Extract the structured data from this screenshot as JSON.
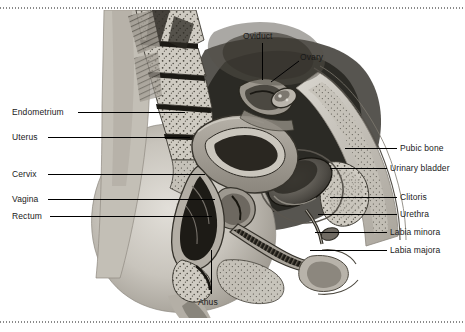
{
  "figure": {
    "background_color": "#ffffff",
    "border_style": "dotted-rule",
    "border_color": "#8a8a8a",
    "label_color": "#1a1a1a",
    "leader_color": "#000000",
    "width": 465,
    "height": 332
  },
  "labels": {
    "endometrium": "Endometrium",
    "uterus": "Uterus",
    "cervix": "Cervix",
    "vagina": "Vagina",
    "rectum": "Rectum",
    "oviduct": "Oviduct",
    "ovary": "Ovary",
    "pubic_bone": "Pubic bone",
    "urinary_bladder": "Urinary bladder",
    "clitoris": "Clitoris",
    "urethra": "Urethra",
    "labia_minora": "Labia minora",
    "labia_majora": "Labia majora",
    "anus": "Anus"
  },
  "label_positions": {
    "endometrium": {
      "x": 12,
      "y": 107,
      "side": "left",
      "line_from": 78,
      "line_to": 185,
      "line_y": 112
    },
    "uterus": {
      "x": 12,
      "y": 132,
      "side": "left",
      "line_from": 48,
      "line_to": 190,
      "line_y": 137
    },
    "cervix": {
      "x": 12,
      "y": 169,
      "side": "left",
      "line_from": 48,
      "line_to": 205,
      "line_y": 174
    },
    "vagina": {
      "x": 12,
      "y": 194,
      "side": "left",
      "line_from": 48,
      "line_to": 215,
      "line_y": 199
    },
    "rectum": {
      "x": 12,
      "y": 211,
      "side": "left",
      "line_from": 50,
      "line_to": 212,
      "line_y": 216
    },
    "oviduct": {
      "x": 243,
      "y": 31,
      "side": "top",
      "line_x": 262,
      "line_y1": 43,
      "line_y2": 80
    },
    "ovary": {
      "x": 300,
      "y": 52,
      "side": "top",
      "line_x1": 298,
      "line_y1": 62,
      "line_x2": 272,
      "line_y2": 82
    },
    "pubic_bone": {
      "x": 400,
      "y": 143,
      "side": "right",
      "line_from": 345,
      "line_to": 397,
      "line_y": 148
    },
    "urinary_bladder": {
      "x": 390,
      "y": 163,
      "side": "right",
      "line_from": 330,
      "line_to": 387,
      "line_y": 168
    },
    "clitoris": {
      "x": 400,
      "y": 192,
      "side": "right",
      "line_from": 330,
      "line_to": 397,
      "line_y": 197
    },
    "urethra": {
      "x": 400,
      "y": 209,
      "side": "right",
      "line_from": 318,
      "line_to": 397,
      "line_y": 214
    },
    "labia_minora": {
      "x": 390,
      "y": 227,
      "side": "right",
      "line_from": 315,
      "line_to": 387,
      "line_y": 232
    },
    "labia_majora": {
      "x": 390,
      "y": 245,
      "side": "right",
      "line_from": 310,
      "line_to": 387,
      "line_y": 250
    },
    "anus": {
      "x": 198,
      "y": 297,
      "side": "bottom",
      "line_x": 211,
      "line_y1": 250,
      "line_y2": 294
    }
  },
  "artwork": {
    "type": "grayscale-medical-illustration",
    "view": "midsagittal",
    "structures": [
      "sacrum-vertebrae",
      "gluteal-soft-tissue",
      "uterus-body",
      "endometrial-cavity",
      "cervix",
      "vaginal-canal",
      "rectum",
      "anal-canal",
      "urinary-bladder",
      "pubic-bone",
      "urethra",
      "labia",
      "oviduct",
      "ovary",
      "abdominal-wall"
    ],
    "palette": {
      "tissue_light": "#d5d2cb",
      "tissue_mid": "#a9a49b",
      "tissue_dark": "#6e6a63",
      "cavity_black": "#16150f",
      "bone_stipple": "#cfcbc2",
      "outline": "#2b2820",
      "skin": "#c9c5bd"
    }
  }
}
